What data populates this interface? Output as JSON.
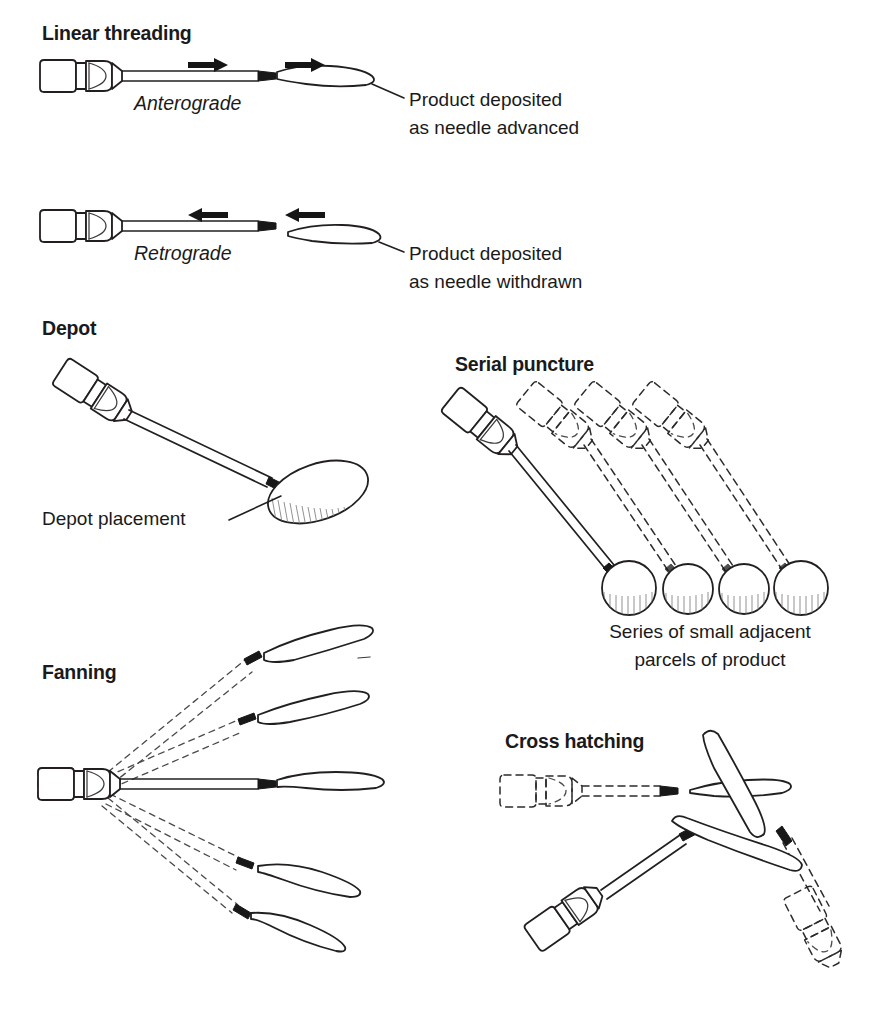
{
  "figure": {
    "background_color": "#ffffff",
    "ink_color": "#231f20"
  },
  "panels": {
    "linear_threading": {
      "heading": "Linear threading",
      "anterograde": {
        "label": "Anterograde",
        "caption_line1": "Product deposited",
        "caption_line2": "as needle advanced",
        "arrow_direction": "right",
        "arrow_count": 2
      },
      "retrograde": {
        "label": "Retrograde",
        "caption_line1": "Product deposited",
        "caption_line2": "as needle withdrawn",
        "arrow_direction": "left",
        "arrow_count": 2
      }
    },
    "depot": {
      "heading": "Depot",
      "caption": "Depot placement",
      "deposit_shape": "oval",
      "deposit_count": 1
    },
    "serial_puncture": {
      "heading": "Serial puncture",
      "caption_line1": "Series of small adjacent",
      "caption_line2": "parcels of product",
      "deposit_count": 4,
      "solid_syringe_count": 1,
      "ghost_syringe_count": 3
    },
    "fanning": {
      "heading": "Fanning",
      "track_count": 5,
      "solid_track_count": 1,
      "ghost_track_count": 4
    },
    "cross_hatching": {
      "heading": "Cross hatching",
      "solid_syringe_count": 1,
      "ghost_syringe_count": 2,
      "trail_count": 3
    }
  }
}
